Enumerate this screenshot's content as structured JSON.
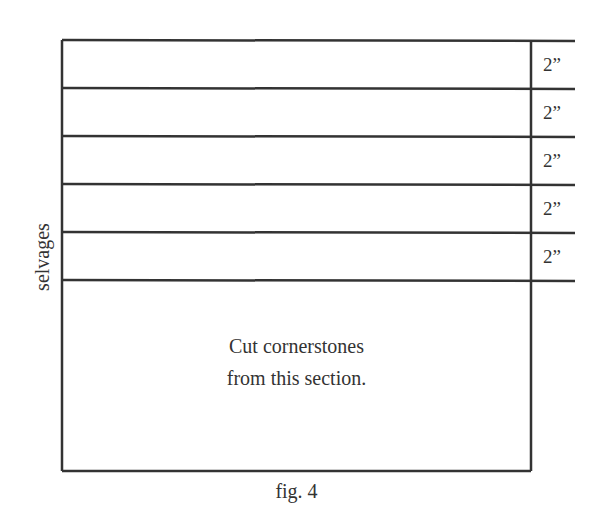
{
  "figure": {
    "caption": "fig. 4",
    "side_label": "selvages",
    "strips": [
      {
        "label": "2”"
      },
      {
        "label": "2”"
      },
      {
        "label": "2”"
      },
      {
        "label": "2”"
      },
      {
        "label": "2”"
      }
    ],
    "section_text_line1": "Cut cornerstones",
    "section_text_line2": "from this section.",
    "line_color": "#333333"
  }
}
